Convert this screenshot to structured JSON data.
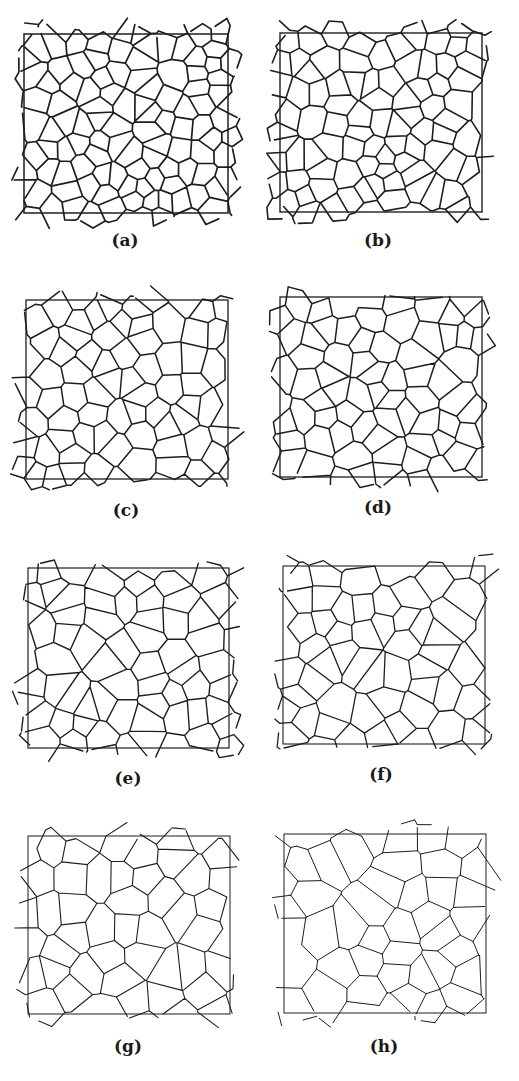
{
  "figure": {
    "line_color": "#1e1e1e",
    "panels": [
      {
        "label": "(a)",
        "box": [
          24,
          34,
          228,
          213
        ],
        "label_pos": [
          125,
          230
        ],
        "cells": 95,
        "stroke": 1.7,
        "seed": 11
      },
      {
        "label": "(b)",
        "box": [
          280,
          33,
          482,
          212
        ],
        "label_pos": [
          378,
          230
        ],
        "cells": 85,
        "stroke": 1.6,
        "seed": 23
      },
      {
        "label": "(c)",
        "box": [
          26,
          300,
          228,
          479
        ],
        "label_pos": [
          126,
          500
        ],
        "cells": 70,
        "stroke": 1.5,
        "seed": 37
      },
      {
        "label": "(d)",
        "box": [
          280,
          297,
          482,
          477
        ],
        "label_pos": [
          378,
          497
        ],
        "cells": 66,
        "stroke": 1.5,
        "seed": 41
      },
      {
        "label": "(e)",
        "box": [
          28,
          568,
          229,
          748
        ],
        "label_pos": [
          128,
          768
        ],
        "cells": 58,
        "stroke": 1.4,
        "seed": 53
      },
      {
        "label": "(f)",
        "box": [
          283,
          566,
          485,
          744
        ],
        "label_pos": [
          381,
          764
        ],
        "cells": 54,
        "stroke": 1.3,
        "seed": 67
      },
      {
        "label": "(g)",
        "box": [
          28,
          836,
          230,
          1014
        ],
        "label_pos": [
          128,
          1036
        ],
        "cells": 46,
        "stroke": 1.1,
        "seed": 79
      },
      {
        "label": "(h)",
        "box": [
          284,
          834,
          486,
          1013
        ],
        "label_pos": [
          384,
          1036
        ],
        "cells": 40,
        "stroke": 1.0,
        "seed": 83
      }
    ]
  }
}
